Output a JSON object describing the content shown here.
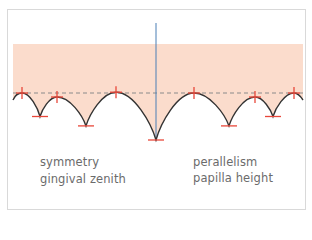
{
  "diagram": {
    "colors": {
      "band": "#fbdccc",
      "curve": "#333333",
      "marker": "#e8473a",
      "midline": "#4a7fb5",
      "reference_line": "#8a8a8a",
      "frame": "#d9d9d9",
      "text": "#6b6b6b"
    },
    "labels": {
      "left_line1": "symmetry",
      "left_line2": "gingival zenith",
      "right_line1": "perallelism",
      "right_line2": "papilla height"
    },
    "peaks": [
      {
        "name": "papilla-1",
        "level": 0.0
      },
      {
        "name": "papilla-2",
        "level": -0.1
      },
      {
        "name": "papilla-3",
        "level": 0.02
      },
      {
        "name": "papilla-4",
        "level": 0.0
      },
      {
        "name": "papilla-5",
        "level": -0.1
      },
      {
        "name": "papilla-6",
        "level": 0.0
      }
    ],
    "valleys": [
      {
        "name": "zenith-1",
        "depth": 0.5
      },
      {
        "name": "zenith-2",
        "depth": 0.7
      },
      {
        "name": "zenith-3",
        "depth": 1.0
      },
      {
        "name": "zenith-4",
        "depth": 0.7
      },
      {
        "name": "zenith-5",
        "depth": 0.5
      }
    ]
  }
}
